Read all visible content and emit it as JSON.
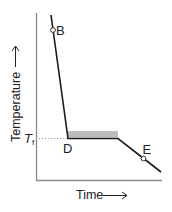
{
  "diagram": {
    "axes": {
      "x_label": "Time",
      "y_label": "Temperature",
      "x_arrow": "→",
      "y_arrow": "→"
    },
    "reference_line": {
      "label_main": "T",
      "label_sub": "f"
    },
    "points": [
      {
        "id": "B",
        "label": "B"
      },
      {
        "id": "D",
        "label": "D"
      },
      {
        "id": "E",
        "label": "E"
      }
    ],
    "colors": {
      "curve": "#1a1a1a",
      "axis": "#888888",
      "plateau_band": "#bdbdbd",
      "dotted_line": "#999999"
    }
  }
}
